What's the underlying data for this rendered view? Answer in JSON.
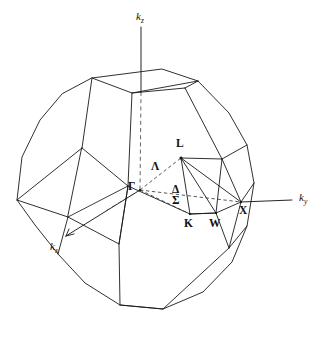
{
  "figure": {
    "kind": "brillouin-zone-diagram",
    "background_color": "#ffffff",
    "line_color": "#1a1a1a",
    "hidden_line_color": "#4a4a4a"
  },
  "axes": [
    {
      "id": "kz",
      "symbol": "k",
      "subscript": "z",
      "label": "kz",
      "direction": "up",
      "x": 136,
      "y": 11
    },
    {
      "id": "ky",
      "symbol": "k",
      "subscript": "y",
      "label": "ky",
      "direction": "right",
      "x": 299,
      "y": 198
    },
    {
      "id": "kx",
      "symbol": "k",
      "subscript": "x",
      "label": "kx",
      "direction": "down-left",
      "x": 50,
      "y": 241
    }
  ],
  "high_symmetry_points": [
    {
      "id": "Gamma",
      "label": "Γ",
      "description": "zone centre",
      "x": 128,
      "y": 181,
      "px": 139,
      "py": 190
    },
    {
      "id": "L",
      "label": "L",
      "description": "centre of hexagonal face",
      "x": 176,
      "y": 138,
      "px": 181,
      "py": 158
    },
    {
      "id": "K",
      "label": "K",
      "description": "edge midpoint",
      "x": 184,
      "y": 218,
      "px": 190,
      "py": 214
    },
    {
      "id": "W",
      "label": "W",
      "description": "zone corner",
      "x": 209,
      "y": 218,
      "px": 216,
      "py": 213
    },
    {
      "id": "X",
      "label": "X",
      "description": "centre of square face",
      "x": 239,
      "y": 205,
      "px": 241,
      "py": 202
    }
  ],
  "symmetry_lines": [
    {
      "id": "Lambda",
      "label": "Λ",
      "from": "Gamma",
      "to": "L",
      "style": "dashed",
      "x": 151,
      "y": 161
    },
    {
      "id": "Delta",
      "label": "Δ",
      "from": "Gamma",
      "to": "X",
      "style": "dashed",
      "x": 172,
      "y": 184
    },
    {
      "id": "Sigma",
      "label": "Σ",
      "from": "Gamma",
      "to": "K",
      "style": "dashed",
      "x": 172,
      "y": 195
    }
  ],
  "accent_colors": {
    "ink": "#1a1a1a",
    "hidden": "#4a4a4a",
    "paper": "#ffffff"
  }
}
